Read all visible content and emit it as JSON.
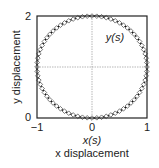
{
  "chart_data": {
    "type": "scatter",
    "title": "",
    "xlabel": "x displacement",
    "ylabel": "y displacement",
    "xlabel_math": "x(s)",
    "annotation": "y(s)",
    "xlim": [
      -1,
      1
    ],
    "ylim": [
      0,
      2
    ],
    "x_ticks": [
      "-1",
      "0",
      "1"
    ],
    "y_ticks": [
      "0",
      "2"
    ],
    "grid": "center crosshair (dotted gray at x=0, y=1)",
    "legend": "none",
    "series": [
      {
        "name": "parametric circle (line)",
        "style": "solid black line",
        "description": "x(s)=cos(s), y(s)=1+sin(s), s in [0, 2pi]",
        "center": [
          0,
          1
        ],
        "radius": 1
      },
      {
        "name": "sample points",
        "style": "open diamond markers",
        "count": 72,
        "center": [
          0,
          1
        ],
        "radius": 1
      }
    ]
  },
  "labels": {
    "x_axis": "x displacement",
    "y_axis": "y displacement",
    "x_math": "x(s)",
    "y_math": "y(s)",
    "tick_x_neg1": "−1",
    "tick_x_0": "0",
    "tick_x_1": "1",
    "tick_y_0": "0",
    "tick_y_2": "2"
  }
}
